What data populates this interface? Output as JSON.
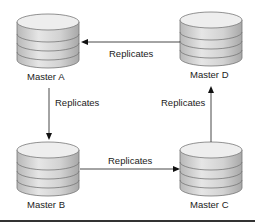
{
  "diagram": {
    "nodes": [
      {
        "id": "A",
        "label": "Master A"
      },
      {
        "id": "B",
        "label": "Master B"
      },
      {
        "id": "C",
        "label": "Master C"
      },
      {
        "id": "D",
        "label": "Master D"
      }
    ],
    "edges": [
      {
        "from": "A",
        "to": "B",
        "label": "Replicates"
      },
      {
        "from": "B",
        "to": "C",
        "label": "Replicates"
      },
      {
        "from": "C",
        "to": "D",
        "label": "Replicates"
      },
      {
        "from": "D",
        "to": "A",
        "label": "Replicates"
      }
    ]
  }
}
